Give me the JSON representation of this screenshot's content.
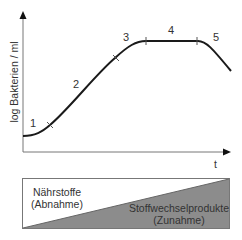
{
  "diagram": {
    "y_axis_label": "log Bakterien / ml",
    "x_axis_label": "t",
    "phases": [
      {
        "label": "1"
      },
      {
        "label": "2"
      },
      {
        "label": "3"
      },
      {
        "label": "4"
      },
      {
        "label": "5"
      }
    ],
    "lower_box": {
      "top_left_text_line1": "Nährstoffe",
      "top_left_text_line2": "(Abnahme)",
      "bottom_right_text_line1": "Stoffwechselprodukte",
      "bottom_right_text_line2": "(Zunahme)",
      "fill_color": "#8c8c8c"
    },
    "curve_color": "#1a1a1a",
    "axis_color": "#777777"
  }
}
